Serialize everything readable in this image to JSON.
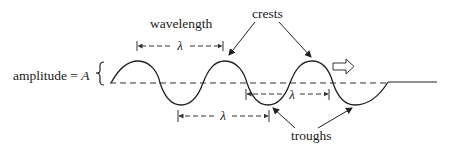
{
  "diagram": {
    "labels": {
      "wavelength": "wavelength",
      "crests": "crests",
      "troughs": "troughs",
      "amplitude_prefix": "amplitude = ",
      "amplitude_symbol": "A",
      "lambda_top": "λ",
      "lambda_middle": "λ",
      "lambda_bottom": "λ"
    },
    "wave": {
      "baseline_y": 83,
      "amplitude_px": 22,
      "wavelength_px": 87,
      "start_x": 111,
      "crests_x": [
        138,
        225,
        312
      ],
      "troughs_x": [
        181,
        268,
        355
      ],
      "end_x": 388,
      "tail_end_x": 437
    },
    "direction_arrow": "open-right-arrow",
    "colors": {
      "stroke": "#222222",
      "dashed": "#333333",
      "background": "#ffffff"
    }
  }
}
